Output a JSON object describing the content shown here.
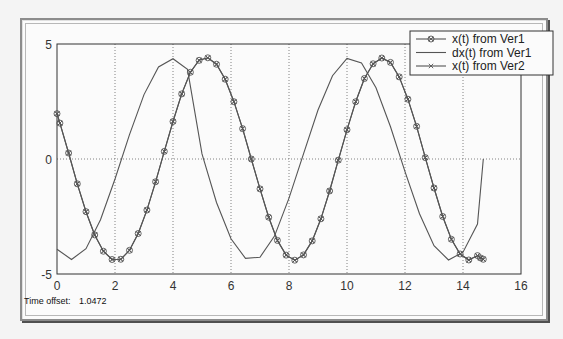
{
  "window": {
    "status_label": "Time offset:",
    "status_value": "1.0472"
  },
  "colors": {
    "line": "#555555",
    "axis": "#333333",
    "grid": "#666666",
    "background": "#fbfbfb"
  },
  "chart_data": {
    "type": "line",
    "title": "",
    "xlabel": "",
    "ylabel": "",
    "xlim": [
      0,
      16
    ],
    "ylim": [
      -5,
      5
    ],
    "xticks": [
      0,
      2,
      4,
      6,
      8,
      10,
      12,
      14,
      16
    ],
    "yticks": [
      -5,
      0,
      5
    ],
    "grid": true,
    "legend_position": "top-right",
    "series": [
      {
        "name": "x(t) from Ver1",
        "marker": "circle",
        "x": [
          0,
          0.1,
          0.4,
          0.7,
          1.0,
          1.3,
          1.6,
          1.9,
          2.2,
          2.5,
          2.8,
          3.1,
          3.4,
          3.7,
          4.0,
          4.3,
          4.6,
          4.9,
          5.2,
          5.5,
          5.8,
          6.1,
          6.4,
          6.7,
          7.0,
          7.3,
          7.6,
          7.9,
          8.2,
          8.5,
          8.8,
          9.1,
          9.4,
          9.7,
          10.0,
          10.3,
          10.6,
          10.9,
          11.2,
          11.5,
          11.8,
          12.1,
          12.4,
          12.7,
          13.0,
          13.3,
          13.6,
          13.9,
          14.2,
          14.5,
          14.6,
          14.7
        ],
        "y": [
          1.97,
          1.56,
          0.26,
          -1.08,
          -2.29,
          -3.3,
          -4.01,
          -4.37,
          -4.36,
          -3.97,
          -3.24,
          -2.22,
          -0.99,
          0.33,
          1.63,
          2.83,
          3.77,
          4.29,
          4.4,
          4.12,
          3.47,
          2.49,
          1.32,
          0.0,
          -1.3,
          -2.53,
          -3.54,
          -4.18,
          -4.4,
          -4.17,
          -3.56,
          -2.6,
          -1.39,
          -0.05,
          1.27,
          2.49,
          3.5,
          4.14,
          4.39,
          4.2,
          3.57,
          2.6,
          1.42,
          0.06,
          -1.26,
          -2.5,
          -3.49,
          -4.13,
          -4.39,
          -4.2,
          -4.3,
          -4.36
        ]
      },
      {
        "name": "dx(t) from Ver1",
        "marker": "none",
        "x": [
          0,
          0.5,
          1.0,
          1.5,
          2.0,
          2.5,
          3.0,
          3.5,
          4.0,
          4.5,
          5.0,
          5.5,
          6.0,
          6.5,
          7.0,
          7.5,
          8.0,
          8.5,
          9.0,
          9.5,
          10.0,
          10.5,
          11.0,
          11.5,
          12.0,
          12.5,
          13.0,
          13.5,
          14.0,
          14.5,
          14.7
        ],
        "y": [
          -3.92,
          -4.37,
          -3.9,
          -2.64,
          -0.87,
          1.06,
          2.8,
          4.0,
          4.36,
          3.9,
          0.22,
          -1.89,
          -3.47,
          -4.32,
          -4.27,
          -3.35,
          -1.7,
          0.22,
          2.13,
          3.62,
          4.37,
          4.18,
          3.1,
          1.4,
          -0.55,
          -2.38,
          -3.77,
          -4.39,
          -4.05,
          -2.83,
          -0.0
        ]
      },
      {
        "name": "x(t) from Ver2",
        "marker": "x",
        "x": [
          0,
          0.1,
          0.4,
          0.7,
          1.0,
          1.3,
          1.6,
          1.9,
          2.2,
          2.5,
          2.8,
          3.1,
          3.4,
          3.7,
          4.0,
          4.3,
          4.6,
          4.9,
          5.2,
          5.5,
          5.8,
          6.1,
          6.4,
          6.7,
          7.0,
          7.3,
          7.6,
          7.9,
          8.2,
          8.5,
          8.8,
          9.1,
          9.4,
          9.7,
          10.0,
          10.3,
          10.6,
          10.9,
          11.2,
          11.5,
          11.8,
          12.1,
          12.4,
          12.7,
          13.0,
          13.3,
          13.6,
          13.9,
          14.2,
          14.5,
          14.6,
          14.7
        ],
        "y": [
          1.97,
          1.56,
          0.26,
          -1.08,
          -2.29,
          -3.3,
          -4.01,
          -4.37,
          -4.36,
          -3.97,
          -3.24,
          -2.22,
          -0.99,
          0.33,
          1.63,
          2.83,
          3.77,
          4.29,
          4.4,
          4.12,
          3.47,
          2.49,
          1.32,
          0.0,
          -1.3,
          -2.53,
          -3.54,
          -4.18,
          -4.4,
          -4.17,
          -3.56,
          -2.6,
          -1.39,
          -0.05,
          1.27,
          2.49,
          3.5,
          4.14,
          4.39,
          4.2,
          3.57,
          2.6,
          1.42,
          0.06,
          -1.26,
          -2.5,
          -3.49,
          -4.13,
          -4.39,
          -4.2,
          -4.3,
          -4.36
        ]
      }
    ]
  }
}
